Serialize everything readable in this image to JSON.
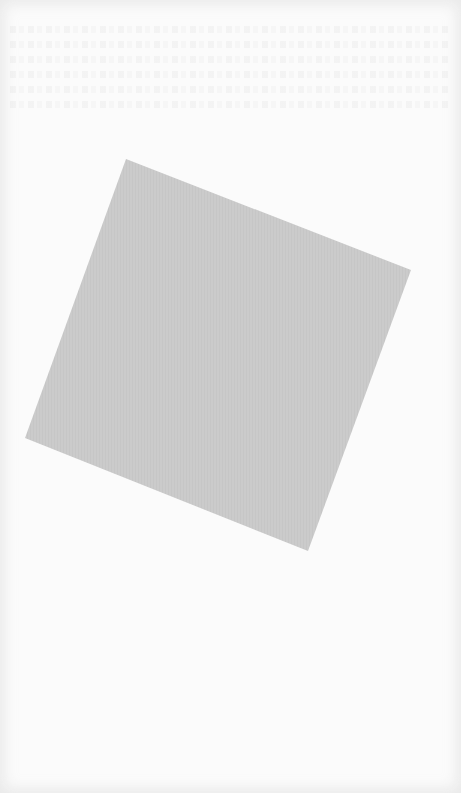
{
  "page": {
    "background_color": "#fbfbfb"
  },
  "shape": {
    "kind": "rotated-square",
    "fill_color": "#cbcbcb",
    "rotation_deg": 22
  },
  "bleed_through_text": {
    "legible": false,
    "line_count": 6
  }
}
